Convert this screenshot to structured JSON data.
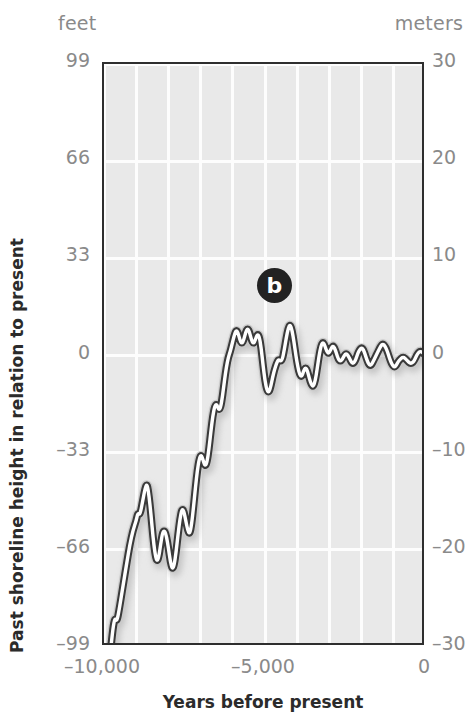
{
  "chart_data": {
    "type": "line",
    "title": "",
    "subtitle": "",
    "xlabel": "Years before present",
    "ylabel": "Past shoreline height in relation to present",
    "left_axis_unit": "feet",
    "right_axis_unit": "meters",
    "xlim": [
      -10000,
      0
    ],
    "ylim_meters": [
      -30,
      30
    ],
    "ylim_feet": [
      -99,
      99
    ],
    "grid": true,
    "legend": "none",
    "x_ticks": [
      {
        "value": -10000,
        "label": "–10,000"
      },
      {
        "value": -5000,
        "label": "–5,000"
      },
      {
        "value": 0,
        "label": "0"
      }
    ],
    "y_ticks_left_feet": [
      {
        "value": 99,
        "label": "99"
      },
      {
        "value": 66,
        "label": "66"
      },
      {
        "value": 33,
        "label": "33"
      },
      {
        "value": 0,
        "label": "0"
      },
      {
        "value": -33,
        "label": "–33"
      },
      {
        "value": -66,
        "label": "–66"
      },
      {
        "value": -99,
        "label": "–99"
      }
    ],
    "y_ticks_right_meters": [
      {
        "value": 30,
        "label": "30"
      },
      {
        "value": 20,
        "label": "20"
      },
      {
        "value": 10,
        "label": "10"
      },
      {
        "value": 0,
        "label": "0"
      },
      {
        "value": -10,
        "label": "–10"
      },
      {
        "value": -20,
        "label": "–20"
      },
      {
        "value": -30,
        "label": "–30"
      }
    ],
    "gridlines_x": [
      -10000,
      -9000,
      -8000,
      -7000,
      -6000,
      -5000,
      -4000,
      -3000,
      -2000,
      -1000,
      0
    ],
    "gridlines_y_meters": [
      30,
      20,
      10,
      0,
      -10,
      -20,
      -30
    ],
    "annotations": [
      {
        "name": "panel-label-b",
        "text": "b",
        "x": -4650,
        "y_meters": 7.0
      }
    ],
    "series": [
      {
        "name": "Past shoreline height",
        "x_unit": "years before present",
        "y_unit": "meters",
        "points": [
          [
            -10000,
            -36.5
          ],
          [
            -9900,
            -33.0
          ],
          [
            -9800,
            -30.5
          ],
          [
            -9720,
            -28.0
          ],
          [
            -9660,
            -27.0
          ],
          [
            -9600,
            -27.4
          ],
          [
            -9520,
            -26.0
          ],
          [
            -9400,
            -23.5
          ],
          [
            -9300,
            -21.5
          ],
          [
            -9200,
            -19.5
          ],
          [
            -9100,
            -18.0
          ],
          [
            -9000,
            -17.0
          ],
          [
            -8950,
            -16.2
          ],
          [
            -8880,
            -16.4
          ],
          [
            -8800,
            -15.0
          ],
          [
            -8720,
            -13.6
          ],
          [
            -8660,
            -13.2
          ],
          [
            -8600,
            -14.5
          ],
          [
            -8540,
            -16.4
          ],
          [
            -8480,
            -18.6
          ],
          [
            -8420,
            -20.3
          ],
          [
            -8360,
            -21.2
          ],
          [
            -8300,
            -20.8
          ],
          [
            -8240,
            -19.4
          ],
          [
            -8180,
            -18.2
          ],
          [
            -8120,
            -18.0
          ],
          [
            -8060,
            -18.6
          ],
          [
            -8000,
            -19.8
          ],
          [
            -7940,
            -21.2
          ],
          [
            -7880,
            -22.0
          ],
          [
            -7820,
            -21.6
          ],
          [
            -7760,
            -20.2
          ],
          [
            -7700,
            -18.4
          ],
          [
            -7640,
            -16.8
          ],
          [
            -7580,
            -15.8
          ],
          [
            -7520,
            -16.0
          ],
          [
            -7460,
            -17.0
          ],
          [
            -7400,
            -18.0
          ],
          [
            -7340,
            -18.4
          ],
          [
            -7280,
            -17.4
          ],
          [
            -7220,
            -15.6
          ],
          [
            -7160,
            -13.6
          ],
          [
            -7100,
            -11.8
          ],
          [
            -7040,
            -10.6
          ],
          [
            -6980,
            -10.2
          ],
          [
            -6920,
            -10.8
          ],
          [
            -6860,
            -11.4
          ],
          [
            -6800,
            -11.0
          ],
          [
            -6740,
            -9.6
          ],
          [
            -6680,
            -7.8
          ],
          [
            -6620,
            -6.2
          ],
          [
            -6560,
            -5.2
          ],
          [
            -6500,
            -5.0
          ],
          [
            -6440,
            -5.6
          ],
          [
            -6380,
            -5.4
          ],
          [
            -6320,
            -4.2
          ],
          [
            -6260,
            -2.6
          ],
          [
            -6200,
            -1.2
          ],
          [
            -6140,
            -0.2
          ],
          [
            -6080,
            0.4
          ],
          [
            -6020,
            1.2
          ],
          [
            -5960,
            2.0
          ],
          [
            -5900,
            2.6
          ],
          [
            -5840,
            2.4
          ],
          [
            -5780,
            1.6
          ],
          [
            -5720,
            1.2
          ],
          [
            -5660,
            1.6
          ],
          [
            -5600,
            2.4
          ],
          [
            -5540,
            2.8
          ],
          [
            -5480,
            2.4
          ],
          [
            -5420,
            1.6
          ],
          [
            -5360,
            1.2
          ],
          [
            -5300,
            1.6
          ],
          [
            -5240,
            2.2
          ],
          [
            -5180,
            2.0
          ],
          [
            -5120,
            0.8
          ],
          [
            -5060,
            -1.0
          ],
          [
            -5000,
            -2.6
          ],
          [
            -4940,
            -3.6
          ],
          [
            -4880,
            -3.8
          ],
          [
            -4820,
            -3.2
          ],
          [
            -4760,
            -2.2
          ],
          [
            -4700,
            -1.4
          ],
          [
            -4640,
            -0.8
          ],
          [
            -4580,
            -0.4
          ],
          [
            -4520,
            -0.6
          ],
          [
            -4460,
            -0.4
          ],
          [
            -4400,
            0.6
          ],
          [
            -4340,
            1.8
          ],
          [
            -4280,
            2.8
          ],
          [
            -4220,
            3.2
          ],
          [
            -4160,
            2.6
          ],
          [
            -4100,
            1.4
          ],
          [
            -4040,
            0.0
          ],
          [
            -3980,
            -1.2
          ],
          [
            -3920,
            -2.0
          ],
          [
            -3860,
            -2.2
          ],
          [
            -3800,
            -1.6
          ],
          [
            -3740,
            -1.2
          ],
          [
            -3680,
            -1.6
          ],
          [
            -3620,
            -2.4
          ],
          [
            -3560,
            -3.0
          ],
          [
            -3500,
            -3.2
          ],
          [
            -3440,
            -2.6
          ],
          [
            -3380,
            -1.4
          ],
          [
            -3320,
            0.0
          ],
          [
            -3260,
            1.0
          ],
          [
            -3200,
            1.4
          ],
          [
            -3140,
            1.0
          ],
          [
            -3080,
            0.4
          ],
          [
            -3020,
            0.2
          ],
          [
            -2960,
            0.6
          ],
          [
            -2900,
            1.0
          ],
          [
            -2840,
            0.8
          ],
          [
            -2780,
            0.2
          ],
          [
            -2720,
            -0.4
          ],
          [
            -2660,
            -0.6
          ],
          [
            -2600,
            -0.4
          ],
          [
            -2540,
            0.0
          ],
          [
            -2480,
            0.2
          ],
          [
            -2420,
            0.0
          ],
          [
            -2360,
            -0.4
          ],
          [
            -2300,
            -0.8
          ],
          [
            -2240,
            -0.8
          ],
          [
            -2180,
            -0.4
          ],
          [
            -2120,
            0.2
          ],
          [
            -2060,
            0.6
          ],
          [
            -2000,
            0.8
          ],
          [
            -1940,
            0.6
          ],
          [
            -1880,
            0.0
          ],
          [
            -1820,
            -0.6
          ],
          [
            -1760,
            -1.0
          ],
          [
            -1700,
            -1.0
          ],
          [
            -1640,
            -0.6
          ],
          [
            -1580,
            -0.2
          ],
          [
            -1520,
            0.2
          ],
          [
            -1460,
            0.6
          ],
          [
            -1400,
            1.0
          ],
          [
            -1340,
            1.2
          ],
          [
            -1280,
            1.0
          ],
          [
            -1220,
            0.6
          ],
          [
            -1160,
            0.0
          ],
          [
            -1100,
            -0.6
          ],
          [
            -1040,
            -1.0
          ],
          [
            -980,
            -1.2
          ],
          [
            -920,
            -1.0
          ],
          [
            -860,
            -0.6
          ],
          [
            -800,
            -0.4
          ],
          [
            -740,
            -0.2
          ],
          [
            -680,
            -0.2
          ],
          [
            -620,
            -0.4
          ],
          [
            -560,
            -0.6
          ],
          [
            -500,
            -0.8
          ],
          [
            -440,
            -0.8
          ],
          [
            -380,
            -0.6
          ],
          [
            -320,
            -0.2
          ],
          [
            -260,
            0.2
          ],
          [
            -200,
            0.4
          ],
          [
            -140,
            0.4
          ],
          [
            -80,
            0.2
          ],
          [
            0,
            0.0
          ]
        ]
      }
    ],
    "colors": {
      "plot_background": "#e9e9e9",
      "gridline": "#fdfdfd",
      "axis_border": "#2e2e2e",
      "curve_outline": "#3a3a3a",
      "curve_fill": "#ffffff",
      "curve_shadow": "#b4b4b4",
      "tick_label": "#8a8a8a",
      "axis_title": "#2b2b2b",
      "marker_background": "#222222",
      "marker_text": "#ffffff"
    }
  }
}
